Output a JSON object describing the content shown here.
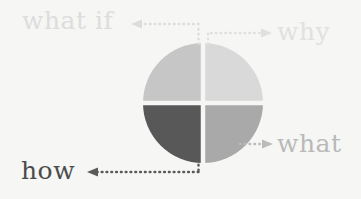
{
  "diagram": {
    "background_color": "#f6f6f4",
    "circle": {
      "center_x": 203,
      "center_y": 103,
      "radius": 60,
      "divider_color": "#f6f6f4",
      "quadrants": [
        {
          "name": "top-left",
          "color": "#c6c6c6",
          "label_ref": "what if"
        },
        {
          "name": "top-right",
          "color": "#d9d9d9",
          "label_ref": "why"
        },
        {
          "name": "bottom-left",
          "color": "#585858",
          "label_ref": "how"
        },
        {
          "name": "bottom-right",
          "color": "#a9a9a9",
          "label_ref": "what"
        }
      ]
    },
    "labels": [
      {
        "id": "what-if",
        "text": "what if",
        "color": "#dddddd",
        "position": "top-left",
        "arrow_direction": "left"
      },
      {
        "id": "why",
        "text": "why",
        "color": "#e1e1e1",
        "position": "top-right",
        "arrow_direction": "right"
      },
      {
        "id": "what",
        "text": "what",
        "color": "#b9b9b9",
        "position": "right",
        "arrow_direction": "right"
      },
      {
        "id": "how",
        "text": "how",
        "color": "#4b4b4b",
        "position": "bottom-left",
        "arrow_direction": "left"
      }
    ],
    "connectors": [
      {
        "id": "what-if-connector",
        "color": "#dcdcdc",
        "style": "dotted"
      },
      {
        "id": "why-connector",
        "color": "#e0e0e0",
        "style": "dotted"
      },
      {
        "id": "what-connector",
        "color": "#bbbbbb",
        "style": "dotted"
      },
      {
        "id": "how-connector",
        "color": "#5a5a5a",
        "style": "dotted"
      }
    ]
  }
}
